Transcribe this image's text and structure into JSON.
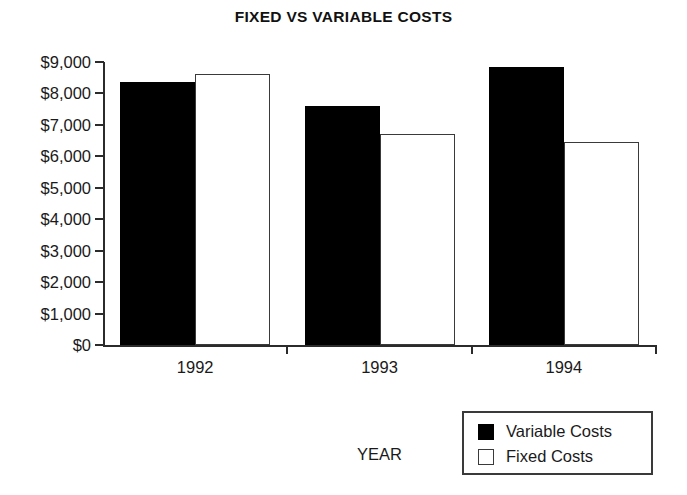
{
  "chart_data": {
    "type": "bar",
    "title": "FIXED VS VARIABLE COSTS",
    "xlabel": "YEAR",
    "ylabel": "",
    "categories": [
      "1992",
      "1993",
      "1994"
    ],
    "series": [
      {
        "name": "Variable Costs",
        "color": "#000000",
        "values": [
          8350,
          8620,
          7600
        ]
      },
      {
        "name": "Fixed Costs",
        "color": "#ffffff",
        "values": [
          6700,
          8850,
          6450
        ]
      }
    ],
    "series_plot": [
      {
        "name": "Variable Costs",
        "values": [
          8350,
          7600,
          8850
        ]
      },
      {
        "name": "Fixed Costs",
        "values": [
          8620,
          6700,
          6450
        ]
      }
    ],
    "ylim": [
      0,
      9000
    ],
    "ytick_values": [
      0,
      1000,
      2000,
      3000,
      4000,
      5000,
      6000,
      7000,
      8000,
      9000
    ],
    "ytick_labels": [
      "$0",
      "$1,000",
      "$2,000",
      "$3,000",
      "$4,000",
      "$5,000",
      "$6,000",
      "$7,000",
      "$8,000",
      "$9,000"
    ],
    "grid": false,
    "legend_position": "bottom-right",
    "legend_entries": [
      {
        "label": "Variable Costs",
        "swatch": "filled-black"
      },
      {
        "label": "Fixed Costs",
        "swatch": "outline-white"
      }
    ]
  }
}
